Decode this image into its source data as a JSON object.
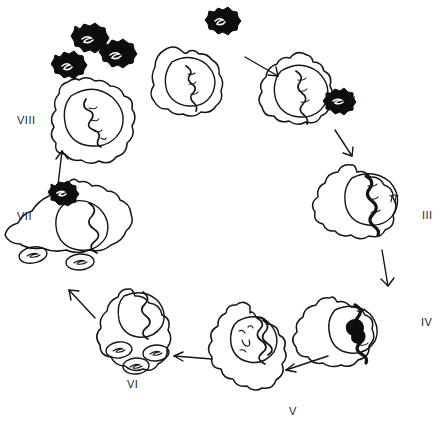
{
  "figure": {
    "type": "diagram",
    "style": "black ink line drawing on white background",
    "background_color": "#ffffff",
    "ink_color": "#141414",
    "width": 448,
    "height": 437,
    "flow": "clockwise cycle beginning at stage I (top centre) and ending at stage VIII (top left)"
  },
  "stages": [
    {
      "id": "I",
      "label": "I",
      "label_x": 236,
      "label_y": 16,
      "description": "free enveloped virus particle with spiked capsid approaching an intact host cell; host cell contains a nucleus with a single coiled DNA strand",
      "elements": [
        "virus-particle",
        "host-cell",
        "nucleus",
        "dna-strand"
      ]
    },
    {
      "id": "II",
      "label": "II",
      "label_x": 352,
      "label_y": 100,
      "description": "virus particle attached to the host cell surface membrane (adsorption / attachment)",
      "elements": [
        "host-cell",
        "nucleus",
        "dna-strand",
        "attached-virus-particle"
      ]
    },
    {
      "id": "III",
      "label": "III",
      "label_x": 425,
      "label_y": 215,
      "description": "viral genome released and entering the nucleus; dense helical DNA now spans the nucleus",
      "elements": [
        "host-cell",
        "nucleus",
        "viral-dna",
        "small-mark"
      ]
    },
    {
      "id": "IV",
      "label": "IV",
      "label_x": 424,
      "label_y": 322,
      "description": "viral DNA inside the nucleus becomes thickened and partly filled in, indicating transcription/replication has begun",
      "elements": [
        "host-cell",
        "nucleus",
        "thickened-viral-dna"
      ]
    },
    {
      "id": "V",
      "label": "V",
      "label_x": 292,
      "label_y": 411,
      "description": "replicated viral genomes accumulate inside the nucleus alongside newly synthesised short strands",
      "elements": [
        "host-cell",
        "nucleus",
        "replicated-dna",
        "nascent-strands"
      ]
    },
    {
      "id": "VI",
      "label": "VI",
      "label_x": 131,
      "label_y": 384,
      "description": "progeny nucleocapsids assembled in the cytoplasm appear as three oval vesicles beside the nucleus",
      "elements": [
        "host-cell",
        "nucleus",
        "viral-dna",
        "assembled-vesicle",
        "assembled-vesicle",
        "assembled-vesicle"
      ]
    },
    {
      "id": "VII",
      "label": "VII",
      "label_x": 20,
      "label_y": 216,
      "description": "mature virion budding out through the host cell membrane; two vesicles remain in the cytoplasm",
      "elements": [
        "host-cell",
        "nucleus",
        "viral-dna",
        "budding-virus-particle",
        "assembled-vesicle",
        "assembled-vesicle"
      ]
    },
    {
      "id": "VIII",
      "label": "VIII",
      "label_x": 20,
      "label_y": 120,
      "description": "three released progeny virus particles leave the host cell, which retains its nucleus and genome, completing the cycle",
      "elements": [
        "released-virus-particle",
        "released-virus-particle",
        "released-virus-particle",
        "host-cell",
        "nucleus",
        "dna-strand"
      ]
    }
  ],
  "arrows": [
    {
      "from": "I",
      "to": "II",
      "direction": "down-right"
    },
    {
      "from": "II",
      "to": "III",
      "direction": "down-right"
    },
    {
      "from": "III",
      "to": "IV",
      "direction": "down"
    },
    {
      "from": "IV",
      "to": "V",
      "direction": "down-left"
    },
    {
      "from": "V",
      "to": "VI",
      "direction": "left"
    },
    {
      "from": "VI",
      "to": "VII",
      "direction": "up-left"
    },
    {
      "from": "VII",
      "to": "VIII",
      "direction": "up"
    }
  ],
  "legend_notes": {
    "virus_particle": "spiked dark capsid enclosing a small white genome squiggle",
    "nucleus": "large open circle drawn inside each cell outline",
    "dna": "wavy / helical line representing the viral or host genome",
    "vesicle": "small oval containing a short squiggle, representing an assembled nucleocapsid"
  }
}
